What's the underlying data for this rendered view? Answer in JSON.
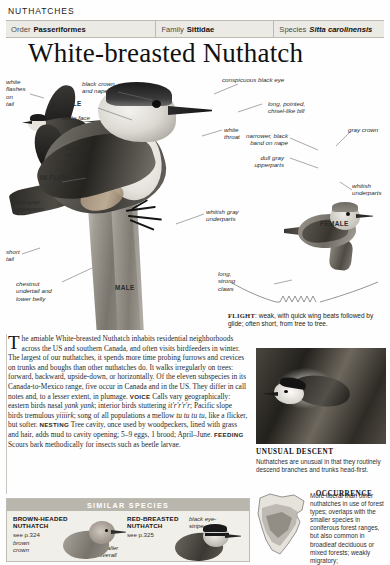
{
  "running_head": "NUTHATCHES",
  "taxonomy": {
    "order_key": "Order",
    "order_value": "Passeriformes",
    "family_key": "Family",
    "family_value": "Sittidae",
    "species_key": "Species",
    "species_value": "Sitta carolinensis"
  },
  "title": "White-breasted Nuthatch",
  "plate_labels": {
    "white_flashes_on_tail": "white\nflashes\non\ntail",
    "male_flight": "MALE",
    "rounded_wings": "rounded\nwings",
    "in_flight": "IN FLIGHT",
    "blue_gray_upperparts": "blue-gray\nupperparts",
    "short_tail": "short\ntail",
    "chestnut_undertail": "chestnut\nundertail and\nlower belly",
    "male_main": "MALE",
    "black_crown_and_nape": "black crown\nand nape",
    "white_face": "white face",
    "conspicuous_black_eye": "conspicuous black eye",
    "long_pointed_bill": "long, pointed,\nchisel-like bill",
    "white_throat": "white\nthroat",
    "whitish_gray_underparts": "whitish gray\nunderparts",
    "long_strong_claws": "long,\nstrong\nclaws",
    "narrower_black_band": "narrower, black\nband on nape",
    "dull_gray_upperparts": "dull gray\nupperparts",
    "gray_crown": "gray crown",
    "whitish_underparts": "whitish\nunderparts",
    "female": "FEMALE"
  },
  "flight": {
    "label": "FLIGHT",
    "text": ": weak, with quick wing beats followed by glide; often short, from tree to tree."
  },
  "body_text": {
    "dropcap": "T",
    "intro": "he amiable White-breasted Nuthatch inhabits residential neighborhoods across the US and southern Canada, and often visits birdfeeders in winter. The largest of our nuthatches, it spends more time probing furrows and crevices on trunks and boughs than other nuthatches do. It walks irregularly on trees: forward, backward, upside-down, or horizontally. Of the eleven subspecies in its Canada-to-Mexico range, five occur in Canada and in the US. They differ in call notes and, to a lesser extent, in plumage.",
    "voice_label": "VOICE",
    "voice_text_1": "Calls vary geographically: eastern birds nasal ",
    "voice_italic_1": "yank yank",
    "voice_text_2": "; interior birds stuttering ",
    "voice_italic_2": "it'r'r'r'r",
    "voice_text_3": "; Pacific slope birds tremulous ",
    "voice_italic_3": "yiiiirk",
    "voice_text_4": "; song of all populations a mellow ",
    "voice_italic_4": "tu tu tu tu",
    "voice_text_5": ", like a flicker, but softer.",
    "nesting_label": "NESTING",
    "nesting_text": "Tree cavity, once used by woodpeckers, lined with grass and hair, adds mud to cavity opening; 5–9 eggs, 1 brood; April–June.",
    "feeding_label": "FEEDING",
    "feeding_text": "Scours bark methodically for insects such as beetle larvae."
  },
  "unusual_descent": {
    "heading": "UNUSUAL DESCENT",
    "text": "Nuthatches are unusual in that they routinely descend branches and trunks head-first."
  },
  "occurrence": {
    "heading": "OCCURRENCE",
    "text": "More liberal than other nuthatches in use of forest types; overlaps with the smaller species in coniferous forest ranges, but also common in broadleaf deciduous or mixed forests; weakly migratory;"
  },
  "similar_species": {
    "heading": "SIMILAR SPECIES",
    "items": [
      {
        "name": "BROWN-HEADED\nNUTHATCH",
        "page": "see p.324",
        "label_1": "brown\ncrown",
        "label_2": "smaller\noverall"
      },
      {
        "name": "RED-BREASTED\nNUTHATCH",
        "page": "see p.325",
        "label_1": "black eye-\nstripe"
      }
    ]
  },
  "colors": {
    "bar_bg": "#eceae4",
    "bar_border": "#bdbab2",
    "simspec_bg": "#f1efe9",
    "simspec_header": "#b9b6ae",
    "text": "#2a2a2a"
  }
}
